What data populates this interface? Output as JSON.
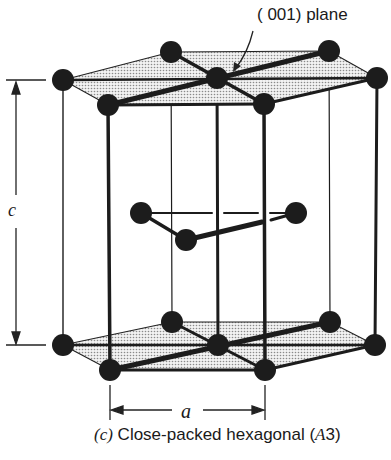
{
  "labels": {
    "plane": "( 001) plane",
    "c": "c",
    "a": "a",
    "caption_prefix": "(c)",
    "caption_text": " Close-packed hexagonal (",
    "caption_italic": "A",
    "caption_suffix": "3)"
  },
  "colors": {
    "atom": "#1c1c1c",
    "plane_fill": "#d9d9d9",
    "line": "#1c1c1c"
  },
  "structure": {
    "type": "hexagonal close-packed",
    "top_plane_atoms": 7,
    "middle_layer_atoms": 3,
    "bottom_plane_atoms": 7
  }
}
